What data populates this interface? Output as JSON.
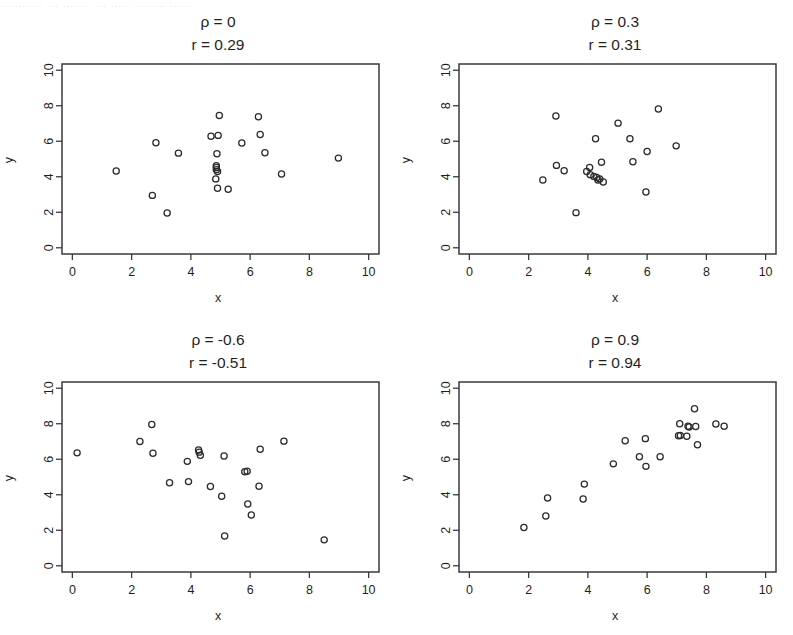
{
  "figure": {
    "scan_remnant_text": "............  ...  .......   ....    ......    ........   ......",
    "background_color": "#ffffff",
    "ink_color": "#2b2b2d",
    "panel_rows": 2,
    "panel_cols": 2
  },
  "axes_common": {
    "xlabel": "x",
    "ylabel": "y",
    "xticks": [
      0,
      2,
      4,
      6,
      8,
      10
    ],
    "yticks": [
      0,
      2,
      4,
      6,
      8,
      10
    ],
    "xtick_labels": [
      "0",
      "2",
      "4",
      "6",
      "8",
      "10"
    ],
    "ytick_labels": [
      "0",
      "2",
      "4",
      "6",
      "8",
      "10"
    ],
    "xlim": [
      -0.35,
      10.35
    ],
    "ylim": [
      -0.35,
      10.35
    ],
    "grid": false,
    "marker": "open-circle"
  },
  "chart_data": [
    {
      "type": "scatter",
      "panel": "top-left",
      "title": "ρ = 0\nr = 0.29",
      "title_line1": "ρ = 0",
      "title_line2": "r = 0.29",
      "rho": 0,
      "r": 0.29,
      "xlabel": "x",
      "ylabel": "y",
      "xlim": [
        -0.35,
        10.35
      ],
      "ylim": [
        -0.35,
        10.35
      ],
      "grid": false,
      "n": 22,
      "points": [
        [
          1.48,
          4.32
        ],
        [
          2.82,
          5.92
        ],
        [
          2.7,
          2.95
        ],
        [
          3.2,
          1.96
        ],
        [
          3.58,
          5.33
        ],
        [
          4.68,
          6.28
        ],
        [
          4.92,
          6.33
        ],
        [
          4.96,
          7.45
        ],
        [
          4.88,
          5.3
        ],
        [
          4.86,
          4.62
        ],
        [
          4.86,
          4.4
        ],
        [
          4.84,
          3.88
        ],
        [
          4.9,
          3.35
        ],
        [
          5.26,
          3.3
        ],
        [
          5.72,
          5.9
        ],
        [
          6.28,
          7.38
        ],
        [
          6.34,
          6.38
        ],
        [
          6.5,
          5.35
        ],
        [
          7.06,
          4.15
        ],
        [
          8.98,
          5.05
        ],
        [
          4.86,
          4.52
        ],
        [
          4.9,
          4.3
        ]
      ]
    },
    {
      "type": "scatter",
      "panel": "top-right",
      "title": "ρ = 0.3\nr = 0.31",
      "title_line1": "ρ = 0.3",
      "title_line2": "r = 0.31",
      "rho": 0.3,
      "r": 0.31,
      "xlabel": "x",
      "ylabel": "y",
      "xlim": [
        -0.35,
        10.35
      ],
      "ylim": [
        -0.35,
        10.35
      ],
      "grid": false,
      "n": 22,
      "points": [
        [
          2.48,
          3.82
        ],
        [
          2.92,
          7.42
        ],
        [
          2.94,
          4.64
        ],
        [
          3.2,
          4.34
        ],
        [
          3.6,
          1.98
        ],
        [
          3.96,
          4.3
        ],
        [
          4.06,
          4.52
        ],
        [
          4.08,
          4.12
        ],
        [
          4.2,
          4.02
        ],
        [
          4.3,
          3.96
        ],
        [
          4.26,
          6.14
        ],
        [
          4.4,
          3.88
        ],
        [
          4.46,
          4.82
        ],
        [
          4.52,
          3.7
        ],
        [
          5.02,
          7.02
        ],
        [
          5.42,
          6.14
        ],
        [
          5.52,
          4.84
        ],
        [
          5.96,
          3.14
        ],
        [
          6.0,
          5.42
        ],
        [
          6.38,
          7.82
        ],
        [
          6.98,
          5.74
        ],
        [
          4.34,
          3.82
        ]
      ]
    },
    {
      "type": "scatter",
      "panel": "bottom-left",
      "title": "ρ = -0.6\nr = -0.51",
      "title_line1": "ρ = -0.6",
      "title_line2": "r = -0.51",
      "rho": -0.6,
      "r": -0.51,
      "xlabel": "x",
      "ylabel": "y",
      "xlim": [
        -0.35,
        10.35
      ],
      "ylim": [
        -0.35,
        10.35
      ],
      "grid": false,
      "n": 22,
      "points": [
        [
          0.16,
          6.36
        ],
        [
          2.28,
          7.0
        ],
        [
          2.68,
          7.96
        ],
        [
          2.72,
          6.34
        ],
        [
          3.28,
          4.68
        ],
        [
          3.88,
          5.88
        ],
        [
          3.92,
          4.74
        ],
        [
          4.26,
          6.52
        ],
        [
          4.32,
          6.22
        ],
        [
          4.66,
          4.46
        ],
        [
          5.04,
          3.92
        ],
        [
          5.12,
          6.18
        ],
        [
          5.14,
          1.68
        ],
        [
          5.82,
          5.3
        ],
        [
          5.92,
          3.48
        ],
        [
          6.04,
          2.86
        ],
        [
          6.3,
          4.48
        ],
        [
          6.34,
          6.56
        ],
        [
          7.14,
          7.02
        ],
        [
          8.5,
          1.46
        ],
        [
          4.28,
          6.4
        ],
        [
          5.9,
          5.32
        ]
      ]
    },
    {
      "type": "scatter",
      "panel": "bottom-right",
      "title": "ρ = 0.9\nr = 0.94",
      "title_line1": "ρ = 0.9",
      "title_line2": "r = 0.94",
      "rho": 0.9,
      "r": 0.94,
      "xlabel": "x",
      "ylabel": "y",
      "xlim": [
        -0.35,
        10.35
      ],
      "ylim": [
        -0.35,
        10.35
      ],
      "grid": false,
      "n": 22,
      "points": [
        [
          1.84,
          2.16
        ],
        [
          2.58,
          2.8
        ],
        [
          2.64,
          3.82
        ],
        [
          3.84,
          3.76
        ],
        [
          3.88,
          4.6
        ],
        [
          4.86,
          5.74
        ],
        [
          5.26,
          7.04
        ],
        [
          5.74,
          6.14
        ],
        [
          5.94,
          7.16
        ],
        [
          5.96,
          5.6
        ],
        [
          6.44,
          6.14
        ],
        [
          7.06,
          7.32
        ],
        [
          7.1,
          8.0
        ],
        [
          7.34,
          7.3
        ],
        [
          7.42,
          7.82
        ],
        [
          7.6,
          8.84
        ],
        [
          7.64,
          7.84
        ],
        [
          7.7,
          6.82
        ],
        [
          8.32,
          7.98
        ],
        [
          8.6,
          7.86
        ],
        [
          7.38,
          7.86
        ],
        [
          7.12,
          7.34
        ]
      ]
    }
  ]
}
